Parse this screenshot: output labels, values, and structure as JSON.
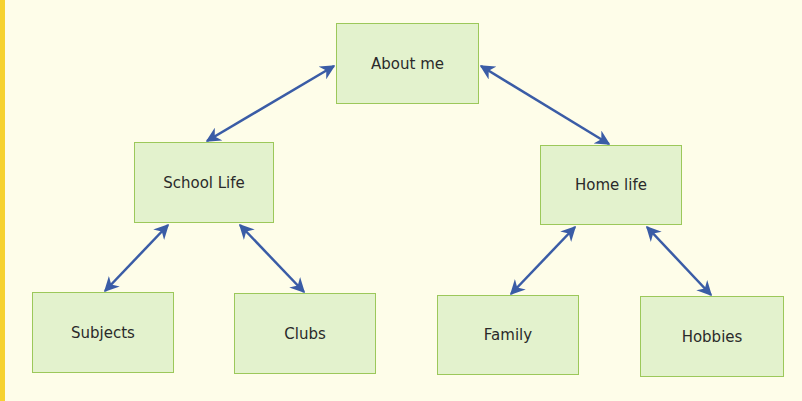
{
  "diagram": {
    "type": "mind-map",
    "colors": {
      "background": "#fefde9",
      "accent_bar": "#f6d230",
      "box_fill": "#e3f2cd",
      "box_border": "#9cc85a",
      "arrow": "#3a5ca6",
      "text": "#2a2a2a"
    },
    "nodes": {
      "root": {
        "label": "About me"
      },
      "school": {
        "label": "School Life"
      },
      "home": {
        "label": "Home life"
      },
      "subjects": {
        "label": "Subjects"
      },
      "clubs": {
        "label": "Clubs"
      },
      "family": {
        "label": "Family"
      },
      "hobbies": {
        "label": "Hobbies"
      }
    },
    "edges": [
      {
        "from": "About me",
        "to": "School Life",
        "type": "bidirectional"
      },
      {
        "from": "About me",
        "to": "Home life",
        "type": "bidirectional"
      },
      {
        "from": "School Life",
        "to": "Subjects",
        "type": "bidirectional"
      },
      {
        "from": "School Life",
        "to": "Clubs",
        "type": "bidirectional"
      },
      {
        "from": "Home life",
        "to": "Family",
        "type": "bidirectional"
      },
      {
        "from": "Home life",
        "to": "Hobbies",
        "type": "bidirectional"
      }
    ]
  }
}
